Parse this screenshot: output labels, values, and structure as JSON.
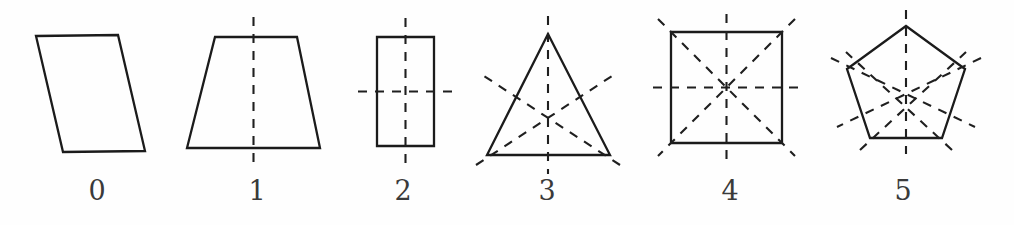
{
  "figure": {
    "background_color": "#fefefe",
    "stroke_color": "#1b1b1b",
    "dash_color": "#1f1f1f",
    "label_color": "#3a3a3a",
    "width": 1014,
    "height": 225
  },
  "shapes": [
    {
      "label": "0",
      "name": "parallelogram",
      "symmetry_line_count": 0,
      "label_x": 97,
      "label_y": 200,
      "outline_points": "36,36 118,35 145,151 63,152",
      "symmetry_lines": []
    },
    {
      "label": "1",
      "name": "trapezoid",
      "symmetry_line_count": 1,
      "label_x": 257,
      "label_y": 200,
      "outline_points": "215,37 297,37 320,148 187,148",
      "symmetry_lines": [
        {
          "x1": 253.5,
          "y1": 17,
          "x2": 253.5,
          "y2": 168
        }
      ]
    },
    {
      "label": "2",
      "name": "rectangle",
      "symmetry_line_count": 2,
      "label_x": 403,
      "label_y": 200,
      "outline_points": "377,37 434,37 434,146 377,146",
      "symmetry_lines": [
        {
          "x1": 405.5,
          "y1": 18,
          "x2": 405.5,
          "y2": 165
        },
        {
          "x1": 358,
          "y1": 91.5,
          "x2": 453,
          "y2": 91.5
        }
      ]
    },
    {
      "label": "3",
      "name": "equilateral-triangle",
      "symmetry_line_count": 3,
      "label_x": 547,
      "label_y": 200,
      "outline_points": "548,34 610,155 487,155",
      "symmetry_lines": [
        {
          "x1": 548,
          "y1": 16,
          "x2": 548,
          "y2": 174
        },
        {
          "x1": 476,
          "y1": 165,
          "x2": 615,
          "y2": 74
        },
        {
          "x1": 620,
          "y1": 165,
          "x2": 481,
          "y2": 74
        }
      ]
    },
    {
      "label": "4",
      "name": "square",
      "symmetry_line_count": 4,
      "label_x": 730,
      "label_y": 200,
      "outline_points": "671,32 782,32 782,143 671,143",
      "symmetry_lines": [
        {
          "x1": 726.5,
          "y1": 14,
          "x2": 726.5,
          "y2": 161
        },
        {
          "x1": 653,
          "y1": 87.5,
          "x2": 800,
          "y2": 87.5
        },
        {
          "x1": 658,
          "y1": 19,
          "x2": 795,
          "y2": 156
        },
        {
          "x1": 795,
          "y1": 19,
          "x2": 658,
          "y2": 156
        }
      ]
    },
    {
      "label": "5",
      "name": "regular-pentagon",
      "symmetry_line_count": 5,
      "label_x": 903,
      "label_y": 200,
      "outline_points": "906,26 965,69 942,138 870,138 847,69",
      "symmetry_lines": [
        {
          "x1": 906,
          "y1": 10,
          "x2": 906,
          "y2": 154
        },
        {
          "x1": 981,
          "y1": 58,
          "x2": 837,
          "y2": 127
        },
        {
          "x1": 952,
          "y1": 150,
          "x2": 846,
          "y2": 52
        },
        {
          "x1": 860,
          "y1": 150,
          "x2": 966,
          "y2": 52
        },
        {
          "x1": 831,
          "y1": 58,
          "x2": 975,
          "y2": 127
        }
      ]
    }
  ]
}
